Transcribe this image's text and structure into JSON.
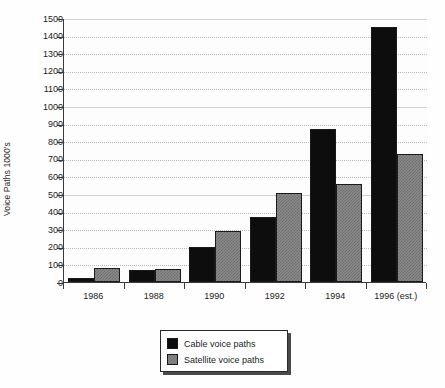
{
  "chart_data": {
    "type": "bar",
    "title": "",
    "subtitle": "",
    "xlabel": "",
    "ylabel": "Voice Paths 1000's",
    "categories": [
      "1986",
      "1988",
      "1990",
      "1992",
      "1994",
      "1996 (est.)"
    ],
    "series": [
      {
        "name": "Cable voice paths",
        "color": "#0d0d0d",
        "values": [
          20,
          70,
          200,
          370,
          870,
          1450
        ]
      },
      {
        "name": "Satellite voice paths",
        "color": "#8a8a8a",
        "values": [
          80,
          75,
          290,
          505,
          555,
          730
        ]
      }
    ],
    "ylim": [
      0,
      1500
    ],
    "yticks": [
      0,
      100,
      200,
      300,
      400,
      500,
      600,
      700,
      800,
      900,
      1000,
      1100,
      1200,
      1300,
      1400,
      1500
    ],
    "ytick_labels": [
      "0",
      "100",
      "200",
      "300",
      "400",
      "500",
      "600",
      "700",
      "800",
      "900",
      "1000",
      "1100",
      "1200",
      "1300",
      "1400",
      "1500"
    ],
    "grid": true,
    "grid_axis": "y",
    "legend_position": "bottom-center",
    "legend_entries": [
      "Cable voice paths",
      "Satellite voice paths"
    ]
  }
}
